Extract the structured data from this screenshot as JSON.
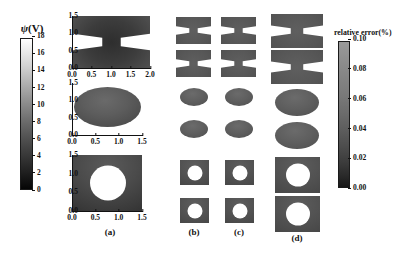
{
  "figure": {
    "type": "scientific-multipanel-grayscale-maps",
    "background": "#ffffff"
  },
  "colorbars": {
    "potential": {
      "title_symbol": "ψ",
      "title_unit": "(V)",
      "title_full": "ψ(V)",
      "ticks": [
        "18",
        "16",
        "14",
        "12",
        "10",
        "8",
        "6",
        "4",
        "2",
        "0"
      ],
      "min": 0,
      "max": 18,
      "orientation": "vertical",
      "colormap": "grayscale",
      "low_color": "#050505",
      "high_color": "#ffffff"
    },
    "error": {
      "title": "relative error(%)",
      "ticks": [
        "0.10",
        "0.08",
        "0.06",
        "0.04",
        "0.02",
        "0.00"
      ],
      "min": 0.0,
      "max": 0.1,
      "orientation": "vertical",
      "colormap": "grayscale",
      "low_color": "#171717",
      "high_color": "#9a9a9a"
    }
  },
  "panel_a": {
    "caption": "(a)",
    "subplots": [
      {
        "name": "bowtie",
        "shape": "hourglass",
        "xticks": [
          "0.0",
          "0.5",
          "1.0",
          "1.5",
          "2.0"
        ],
        "yticks": [
          "1.5",
          "1.0",
          "0.5",
          "0.0"
        ],
        "xlim": [
          0.0,
          2.0
        ],
        "ylim": [
          0.0,
          1.5
        ]
      },
      {
        "name": "ellipse",
        "shape": "ellipse",
        "xticks": [
          "0.0",
          "0.5",
          "1.0",
          "1.5"
        ],
        "yticks": [
          "1.5",
          "1.0",
          "0.5",
          "0.0"
        ],
        "xlim": [
          0.0,
          1.5
        ],
        "ylim": [
          0.0,
          1.5
        ]
      },
      {
        "name": "square-with-hole",
        "shape": "square-hole",
        "xticks": [
          "0.0",
          "0.5",
          "1.0",
          "1.5"
        ],
        "yticks": [
          "1.5",
          "1.0",
          "0.5",
          "0.0"
        ],
        "xlim": [
          0.0,
          1.5
        ],
        "ylim": [
          0.0,
          1.5
        ]
      }
    ]
  },
  "error_columns": [
    {
      "caption": "(b)",
      "scale": "small"
    },
    {
      "caption": "(c)",
      "scale": "small"
    },
    {
      "caption": "(d)",
      "scale": "large"
    }
  ],
  "error_rows": [
    {
      "shape": "hourglass"
    },
    {
      "shape": "hourglass"
    },
    {
      "shape": "ellipse"
    },
    {
      "shape": "ellipse"
    },
    {
      "shape": "square-hole"
    },
    {
      "shape": "square-hole"
    }
  ],
  "chart_data": {
    "type": "heatmap",
    "title": "",
    "xlabel": "",
    "ylabel": "",
    "grid": false,
    "legend_position": "left-and-right-colorbars",
    "colorbars": [
      {
        "name": "potential",
        "label": "ψ(V)",
        "tick_values": [
          18,
          16,
          14,
          12,
          10,
          8,
          6,
          4,
          2,
          0
        ],
        "range": [
          0,
          18
        ]
      },
      {
        "name": "relative-error",
        "label": "relative error(%)",
        "tick_values": [
          0.1,
          0.08,
          0.06,
          0.04,
          0.02,
          0.0
        ],
        "range": [
          0.0,
          0.1
        ]
      }
    ],
    "panels": [
      {
        "id": "a1",
        "column": "(a)",
        "geometry": "hourglass",
        "quantity": "ψ(V)",
        "x_ticks": [
          0.0,
          0.5,
          1.0,
          1.5,
          2.0
        ],
        "y_ticks": [
          0.0,
          0.5,
          1.0,
          1.5
        ],
        "xlim": [
          0.0,
          2.0
        ],
        "ylim": [
          0.0,
          1.5
        ]
      },
      {
        "id": "a2",
        "column": "(a)",
        "geometry": "ellipse",
        "quantity": "ψ(V)",
        "x_ticks": [
          0.0,
          0.5,
          1.0,
          1.5
        ],
        "y_ticks": [
          0.0,
          0.5,
          1.0,
          1.5
        ],
        "xlim": [
          0.0,
          1.5
        ],
        "ylim": [
          0.0,
          1.5
        ]
      },
      {
        "id": "a3",
        "column": "(a)",
        "geometry": "square-with-circular-hole",
        "quantity": "ψ(V)",
        "x_ticks": [
          0.0,
          0.5,
          1.0,
          1.5
        ],
        "y_ticks": [
          0.0,
          0.5,
          1.0,
          1.5
        ],
        "xlim": [
          0.0,
          1.5
        ],
        "ylim": [
          0.0,
          1.5
        ]
      },
      {
        "id": "b1",
        "column": "(b)",
        "geometry": "hourglass",
        "quantity": "relative error(%)"
      },
      {
        "id": "b2",
        "column": "(b)",
        "geometry": "hourglass",
        "quantity": "relative error(%)"
      },
      {
        "id": "b3",
        "column": "(b)",
        "geometry": "ellipse",
        "quantity": "relative error(%)"
      },
      {
        "id": "b4",
        "column": "(b)",
        "geometry": "ellipse",
        "quantity": "relative error(%)"
      },
      {
        "id": "b5",
        "column": "(b)",
        "geometry": "square-with-circular-hole",
        "quantity": "relative error(%)"
      },
      {
        "id": "b6",
        "column": "(b)",
        "geometry": "square-with-circular-hole",
        "quantity": "relative error(%)"
      },
      {
        "id": "c1",
        "column": "(c)",
        "geometry": "hourglass",
        "quantity": "relative error(%)"
      },
      {
        "id": "c2",
        "column": "(c)",
        "geometry": "hourglass",
        "quantity": "relative error(%)"
      },
      {
        "id": "c3",
        "column": "(c)",
        "geometry": "ellipse",
        "quantity": "relative error(%)"
      },
      {
        "id": "c4",
        "column": "(c)",
        "geometry": "ellipse",
        "quantity": "relative error(%)"
      },
      {
        "id": "c5",
        "column": "(c)",
        "geometry": "square-with-circular-hole",
        "quantity": "relative error(%)"
      },
      {
        "id": "c6",
        "column": "(c)",
        "geometry": "square-with-circular-hole",
        "quantity": "relative error(%)"
      },
      {
        "id": "d1",
        "column": "(d)",
        "geometry": "hourglass",
        "quantity": "relative error(%)"
      },
      {
        "id": "d2",
        "column": "(d)",
        "geometry": "hourglass",
        "quantity": "relative error(%)"
      },
      {
        "id": "d3",
        "column": "(d)",
        "geometry": "ellipse",
        "quantity": "relative error(%)"
      },
      {
        "id": "d4",
        "column": "(d)",
        "geometry": "ellipse",
        "quantity": "relative error(%)"
      },
      {
        "id": "d5",
        "column": "(d)",
        "geometry": "square-with-circular-hole",
        "quantity": "relative error(%)"
      },
      {
        "id": "d6",
        "column": "(d)",
        "geometry": "square-with-circular-hole",
        "quantity": "relative error(%)"
      }
    ]
  }
}
